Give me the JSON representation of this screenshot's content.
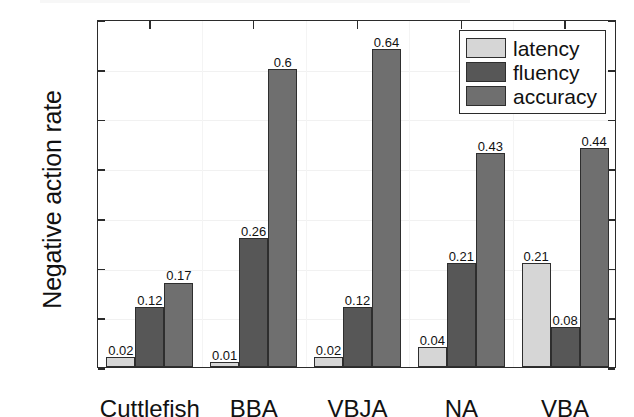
{
  "chart_data": {
    "type": "bar",
    "title": "",
    "xlabel": "",
    "ylabel": "Negative action rate",
    "categories": [
      "Cuttlefish",
      "BBA",
      "VBJA",
      "NA",
      "VBA"
    ],
    "series": [
      {
        "name": "latency",
        "color": "#d6d6d6",
        "values": [
          0.02,
          0.01,
          0.02,
          0.04,
          0.21
        ]
      },
      {
        "name": "fluency",
        "color": "#575757",
        "values": [
          0.12,
          0.26,
          0.12,
          0.21,
          0.08
        ]
      },
      {
        "name": "accuracy",
        "color": "#6f6f6f",
        "values": [
          0.17,
          0.6,
          0.64,
          0.43,
          0.44
        ]
      }
    ],
    "value_labels": [
      [
        "0.02",
        "0.12",
        "0.17"
      ],
      [
        "0.01",
        "0.26",
        "0.6"
      ],
      [
        "0.02",
        "0.12",
        "0.64"
      ],
      [
        "0.04",
        "0.21",
        "0.43"
      ],
      [
        "0.21",
        "0.08",
        "0.44"
      ]
    ],
    "ylim": [
      0,
      0.7
    ],
    "ytick_labels": [
      "0",
      "0.1",
      "0.2",
      "0.3",
      "0.4",
      "0.5",
      "0.6",
      "0.7"
    ],
    "ytick_values": [
      0,
      0.1,
      0.2,
      0.3,
      0.4,
      0.5,
      0.6,
      0.7
    ],
    "grid": true,
    "legend_position": "top-right",
    "legend_entries": [
      "latency",
      "fluency",
      "accuracy"
    ]
  }
}
